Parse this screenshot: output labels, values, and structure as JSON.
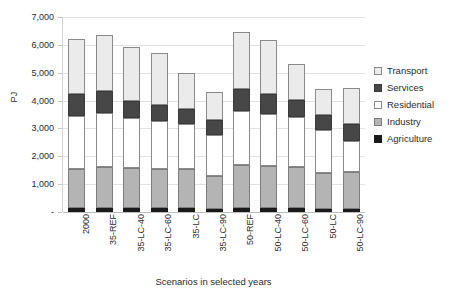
{
  "chart_data": {
    "type": "bar",
    "stacked": true,
    "title": "",
    "xlabel": "Scenarios in selected years",
    "ylabel": "PJ",
    "ylim": [
      0,
      7000
    ],
    "ytick_step": 1000,
    "ytick_labels": [
      "-",
      "1,000",
      "2,000",
      "3,000",
      "4,000",
      "5,000",
      "6,000",
      "7,000"
    ],
    "ytick_values": [
      0,
      1000,
      2000,
      3000,
      4000,
      5000,
      6000,
      7000
    ],
    "grid": true,
    "legend_position": "right",
    "categories": [
      "2000",
      "35-REF",
      "35-LC-40",
      "35-LC-60",
      "35-LC",
      "35-LC-90",
      "50-REF",
      "50-LC-40",
      "50-LC-60",
      "50-LC",
      "50-LC-90"
    ],
    "series": [
      {
        "name": "Agriculture",
        "color": "#1a1a1a",
        "values": [
          130,
          130,
          130,
          130,
          130,
          120,
          130,
          130,
          130,
          120,
          120
        ]
      },
      {
        "name": "Industry",
        "color": "#b4b4b4",
        "values": [
          1420,
          1490,
          1440,
          1420,
          1420,
          1190,
          1570,
          1520,
          1480,
          1290,
          1300
        ]
      },
      {
        "name": "Residential",
        "color": "#ffffff",
        "values": [
          1900,
          1930,
          1810,
          1720,
          1610,
          1460,
          1940,
          1860,
          1790,
          1550,
          1120
        ]
      },
      {
        "name": "Services",
        "color": "#474747",
        "values": [
          790,
          780,
          620,
          580,
          530,
          520,
          790,
          740,
          610,
          540,
          610
        ]
      },
      {
        "name": "Transport",
        "color": "#ebebeb",
        "values": [
          1990,
          2040,
          1940,
          1850,
          1310,
          1030,
          2030,
          1930,
          1310,
          920,
          1300
        ]
      }
    ],
    "totals": [
      6230,
      6370,
      5940,
      5700,
      5000,
      4320,
      6460,
      6180,
      5320,
      4420,
      4450
    ]
  },
  "legend": {
    "items": [
      {
        "label": "Transport",
        "swatch": "swatch-transport-icon"
      },
      {
        "label": "Services",
        "swatch": "swatch-services-icon"
      },
      {
        "label": "Residential",
        "swatch": "swatch-residential-icon"
      },
      {
        "label": "Industry",
        "swatch": "swatch-industry-icon"
      },
      {
        "label": "Agriculture",
        "swatch": "swatch-agriculture-icon"
      }
    ]
  },
  "colors": {
    "transport": "#ebebeb",
    "services": "#474747",
    "residential": "#ffffff",
    "industry": "#b4b4b4",
    "agriculture": "#1a1a1a",
    "grid": "#e2e2e2",
    "axis": "#bdbdbd",
    "text": "#2b2b2b"
  }
}
